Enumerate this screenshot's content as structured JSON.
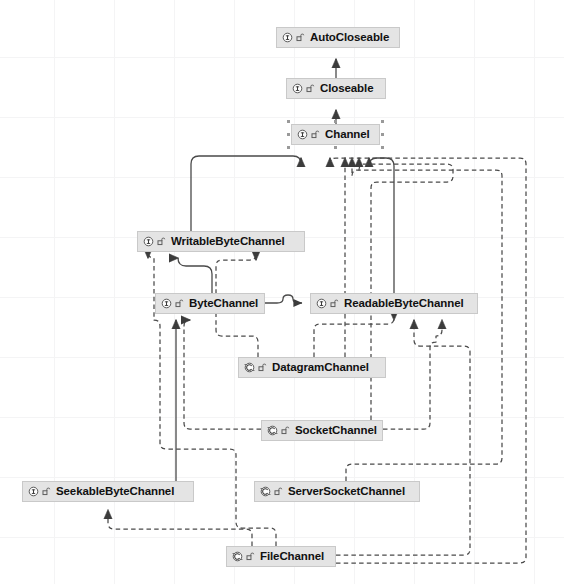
{
  "diagram": {
    "background_color": "#ffffff",
    "grid_color": "#f4f4f5",
    "node_fill": "#e4e4e4",
    "node_border": "#c9c9c9",
    "edge_color": "#4a4a4a",
    "icons": {
      "interface": "interface-icon",
      "abstract_class": "abstract-class-icon",
      "visibility": "visibility-public-icon"
    },
    "nodes": [
      {
        "id": "autocloseable",
        "label": "AutoCloseable",
        "kind": "interface",
        "x": 276,
        "y": 27,
        "w": 124,
        "selected": false
      },
      {
        "id": "closeable",
        "label": "Closeable",
        "kind": "interface",
        "x": 286,
        "y": 78,
        "w": 100,
        "selected": false
      },
      {
        "id": "channel",
        "label": "Channel",
        "kind": "interface",
        "x": 291,
        "y": 124,
        "w": 89,
        "selected": true
      },
      {
        "id": "writablebytechannel",
        "label": "WritableByteChannel",
        "kind": "interface",
        "x": 137,
        "y": 231,
        "w": 168,
        "selected": false
      },
      {
        "id": "bytechannel",
        "label": "ByteChannel",
        "kind": "interface",
        "x": 155,
        "y": 293,
        "w": 110,
        "selected": false
      },
      {
        "id": "readablebytechannel",
        "label": "ReadableByteChannel",
        "kind": "interface",
        "x": 310,
        "y": 293,
        "w": 168,
        "selected": false
      },
      {
        "id": "datagramchannel",
        "label": "DatagramChannel",
        "kind": "abstract_class",
        "x": 238,
        "y": 357,
        "w": 148,
        "selected": false
      },
      {
        "id": "socketchannel",
        "label": "SocketChannel",
        "kind": "abstract_class",
        "x": 261,
        "y": 420,
        "w": 122,
        "selected": false
      },
      {
        "id": "seekablebytechannel",
        "label": "SeekableByteChannel",
        "kind": "interface",
        "x": 22,
        "y": 481,
        "w": 172,
        "selected": false
      },
      {
        "id": "serversocketchannel",
        "label": "ServerSocketChannel",
        "kind": "abstract_class",
        "x": 254,
        "y": 481,
        "w": 166,
        "selected": false
      },
      {
        "id": "filechannel",
        "label": "FileChannel",
        "kind": "abstract_class",
        "x": 226,
        "y": 546,
        "w": 110,
        "selected": false
      }
    ],
    "edges": [
      {
        "from": "closeable",
        "to": "autocloseable",
        "style": "solid",
        "arrow": "hollow-triangle"
      },
      {
        "from": "channel",
        "to": "closeable",
        "style": "solid",
        "arrow": "hollow-triangle"
      },
      {
        "from": "writablebytechannel",
        "to": "channel",
        "style": "solid",
        "arrow": "hollow-triangle"
      },
      {
        "from": "readablebytechannel",
        "to": "channel",
        "style": "solid",
        "arrow": "hollow-triangle"
      },
      {
        "from": "bytechannel",
        "to": "writablebytechannel",
        "style": "solid",
        "arrow": "hollow-triangle"
      },
      {
        "from": "bytechannel",
        "to": "readablebytechannel",
        "style": "solid",
        "arrow": "open-arrow"
      },
      {
        "from": "seekablebytechannel",
        "to": "bytechannel",
        "style": "solid",
        "arrow": "hollow-triangle"
      },
      {
        "from": "datagramchannel",
        "to": "writablebytechannel",
        "style": "dashed",
        "arrow": "hollow-triangle"
      },
      {
        "from": "datagramchannel",
        "to": "readablebytechannel",
        "style": "dashed",
        "arrow": "hollow-triangle"
      },
      {
        "from": "datagramchannel",
        "to": "channel",
        "style": "dashed",
        "arrow": "hollow-triangle"
      },
      {
        "from": "socketchannel",
        "to": "writablebytechannel",
        "style": "dashed",
        "arrow": "hollow-triangle"
      },
      {
        "from": "socketchannel",
        "to": "readablebytechannel",
        "style": "dashed",
        "arrow": "hollow-triangle"
      },
      {
        "from": "socketchannel",
        "to": "channel",
        "style": "dashed",
        "arrow": "hollow-triangle"
      },
      {
        "from": "serversocketchannel",
        "to": "channel",
        "style": "dashed",
        "arrow": "hollow-triangle"
      },
      {
        "from": "filechannel",
        "to": "seekablebytechannel",
        "style": "dashed",
        "arrow": "hollow-triangle"
      },
      {
        "from": "filechannel",
        "to": "writablebytechannel",
        "style": "dashed",
        "arrow": "hollow-triangle"
      },
      {
        "from": "filechannel",
        "to": "readablebytechannel",
        "style": "dashed",
        "arrow": "hollow-triangle"
      },
      {
        "from": "filechannel",
        "to": "channel",
        "style": "dashed",
        "arrow": "hollow-triangle"
      }
    ]
  }
}
